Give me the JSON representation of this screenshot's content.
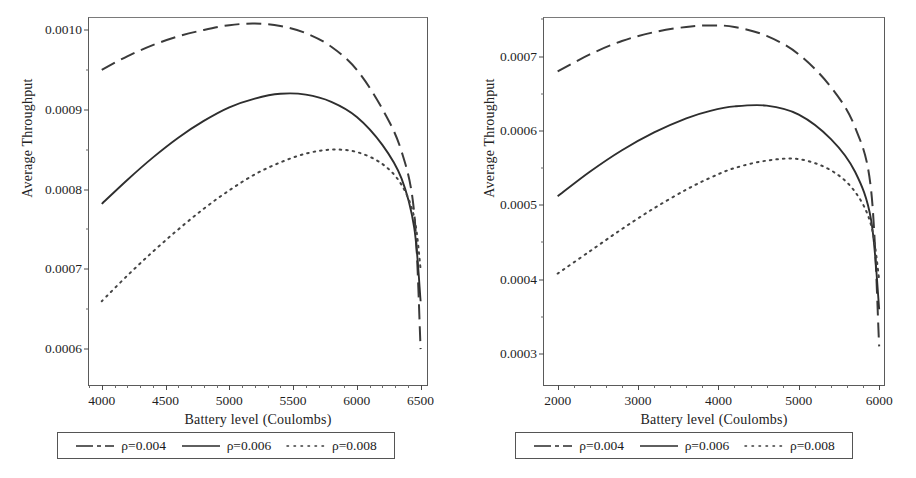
{
  "scan": {
    "header_fragment": " "
  },
  "legend_shared": {
    "entries": [
      {
        "label": "ρ=0.004",
        "style": "dashed"
      },
      {
        "label": "ρ=0.006",
        "style": "solid"
      },
      {
        "label": "ρ=0.008",
        "style": "dotted"
      }
    ]
  },
  "panels": [
    {
      "name": "left-panel",
      "xlabel": "Battery level (Coulombs)",
      "ylabel": "Average Throughput"
    },
    {
      "name": "right-panel",
      "xlabel": "Battery level (Coulombs)",
      "ylabel": "Average Throughput"
    }
  ],
  "chart_data": [
    {
      "type": "line",
      "id": "left-chart",
      "title": "",
      "xlabel": "Battery level (Coulombs)",
      "ylabel": "Average Throughput",
      "xlim": [
        3900,
        6550
      ],
      "ylim": [
        0.000555,
        0.001015
      ],
      "xticks": [
        4000,
        4500,
        5000,
        5500,
        6000,
        6500
      ],
      "xticklabels": [
        "4000",
        "4500",
        "5000",
        "5500",
        "6000",
        "6500"
      ],
      "yticks": [
        0.0006,
        0.0007,
        0.0008,
        0.0009,
        0.001
      ],
      "yticklabels": [
        "0.0006",
        "0.0007",
        "0.0008",
        "0.0009",
        "0.0010"
      ],
      "grid": false,
      "legend_position": "below",
      "series": [
        {
          "name": "ρ=0.004",
          "style": "dashed",
          "x": [
            4000,
            4200,
            4400,
            4600,
            4800,
            5000,
            5200,
            5400,
            5600,
            5800,
            6000,
            6200,
            6350,
            6450,
            6500
          ],
          "y": [
            0.00095,
            0.000967,
            0.000981,
            0.000992,
            0.001,
            0.001006,
            0.001008,
            0.001005,
            0.000996,
            0.000979,
            0.00095,
            0.000901,
            0.000848,
            0.00077,
            0.0006
          ]
        },
        {
          "name": "ρ=0.006",
          "style": "solid",
          "x": [
            4000,
            4200,
            4400,
            4600,
            4800,
            5000,
            5200,
            5400,
            5600,
            5800,
            6000,
            6200,
            6350,
            6450,
            6500
          ],
          "y": [
            0.000782,
            0.000812,
            0.00084,
            0.000865,
            0.000886,
            0.000903,
            0.000914,
            0.00092,
            0.000919,
            0.00091,
            0.000891,
            0.000856,
            0.000814,
            0.000752,
            0.00066
          ]
        },
        {
          "name": "ρ=0.008",
          "style": "dotted",
          "x": [
            4000,
            4200,
            4400,
            4600,
            4800,
            5000,
            5200,
            5400,
            5600,
            5800,
            6000,
            6200,
            6350,
            6450,
            6500
          ],
          "y": [
            0.00066,
            0.000692,
            0.000722,
            0.00075,
            0.000776,
            0.000799,
            0.000819,
            0.000834,
            0.000845,
            0.00085,
            0.000847,
            0.000832,
            0.000806,
            0.000765,
            0.0007
          ]
        }
      ]
    },
    {
      "type": "line",
      "id": "right-chart",
      "title": "",
      "xlabel": "Battery level (Coulombs)",
      "ylabel": "Average Throughput",
      "xlim": [
        1830,
        6060
      ],
      "ylim": [
        0.000258,
        0.000752
      ],
      "xticks": [
        2000,
        3000,
        4000,
        5000,
        6000
      ],
      "xticklabels": [
        "2000",
        "3000",
        "4000",
        "5000",
        "6000"
      ],
      "yticks": [
        0.0003,
        0.0004,
        0.0005,
        0.0006,
        0.0007
      ],
      "yticklabels": [
        "0.0003",
        "0.0004",
        "0.0005",
        "0.0006",
        "0.0007"
      ],
      "grid": false,
      "legend_position": "below",
      "series": [
        {
          "name": "ρ=0.004",
          "style": "dashed",
          "x": [
            2000,
            2400,
            2800,
            3200,
            3600,
            3900,
            4200,
            4600,
            5000,
            5400,
            5700,
            5900,
            6000
          ],
          "y": [
            0.00068,
            0.000703,
            0.000721,
            0.000733,
            0.00074,
            0.000742,
            0.00074,
            0.000728,
            0.000703,
            0.000659,
            0.000605,
            0.00052,
            0.00031
          ]
        },
        {
          "name": "ρ=0.006",
          "style": "solid",
          "x": [
            2000,
            2400,
            2800,
            3200,
            3600,
            3900,
            4200,
            4600,
            5000,
            5400,
            5700,
            5900,
            6000
          ],
          "y": [
            0.000512,
            0.000545,
            0.000574,
            0.000598,
            0.000617,
            0.000627,
            0.000633,
            0.000634,
            0.000622,
            0.000589,
            0.000545,
            0.00048,
            0.00036
          ]
        },
        {
          "name": "ρ=0.008",
          "style": "dotted",
          "x": [
            2000,
            2400,
            2800,
            3200,
            3600,
            3900,
            4200,
            4600,
            5000,
            5400,
            5700,
            5900,
            6000
          ],
          "y": [
            0.000408,
            0.000438,
            0.000468,
            0.000496,
            0.000521,
            0.000537,
            0.00055,
            0.00056,
            0.000562,
            0.000547,
            0.000518,
            0.000473,
            0.0004
          ]
        }
      ]
    }
  ]
}
